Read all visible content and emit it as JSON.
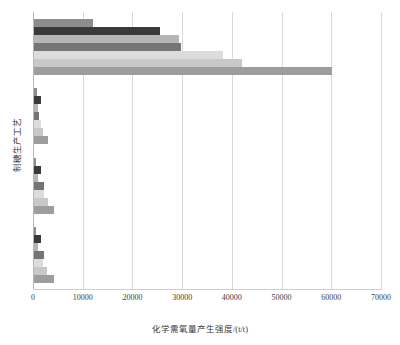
{
  "chart_data": {
    "type": "bar",
    "orientation": "horizontal",
    "title": "",
    "xlabel": "化学需氧量产生强度/(t/t)",
    "ylabel": "制糖生产工艺",
    "xlim": [
      0,
      70000
    ],
    "ylim": [
      0,
      4
    ],
    "grid": "vertical",
    "legend_position": "none",
    "xticks": [
      "0",
      "10000",
      "20000",
      "30000",
      "40000",
      "50000",
      "60000",
      "70000"
    ],
    "xtick_values": [
      0,
      10000,
      20000,
      30000,
      40000,
      50000,
      60000,
      70000
    ],
    "categories": [
      "工艺一",
      "工艺二",
      "工艺三",
      "工艺四"
    ],
    "series": [
      {
        "name": "系列1",
        "color": "#8c8c8c",
        "values": [
          11800,
          600,
          500,
          450
        ]
      },
      {
        "name": "系列2",
        "color": "#3a3a3a",
        "values": [
          25400,
          1500,
          1450,
          1400
        ]
      },
      {
        "name": "系列3",
        "color": "#b5b5b5",
        "values": [
          29100,
          900,
          900,
          900
        ]
      },
      {
        "name": "系列4",
        "color": "#757575",
        "values": [
          29600,
          1100,
          2100,
          2000
        ]
      },
      {
        "name": "系列5",
        "color": "#dcdcdc",
        "values": [
          38000,
          1400,
          2000,
          1900
        ]
      },
      {
        "name": "系列6",
        "color": "#c8c8c8",
        "values": [
          41900,
          1900,
          2900,
          2700
        ]
      },
      {
        "name": "系列7",
        "color": "#9d9d9d",
        "values": [
          60000,
          2800,
          4100,
          4000
        ]
      }
    ]
  },
  "axis": {
    "xlabel": "化学需氧量产生强度/(t/t)",
    "ylabel": "制糖生产工艺"
  }
}
